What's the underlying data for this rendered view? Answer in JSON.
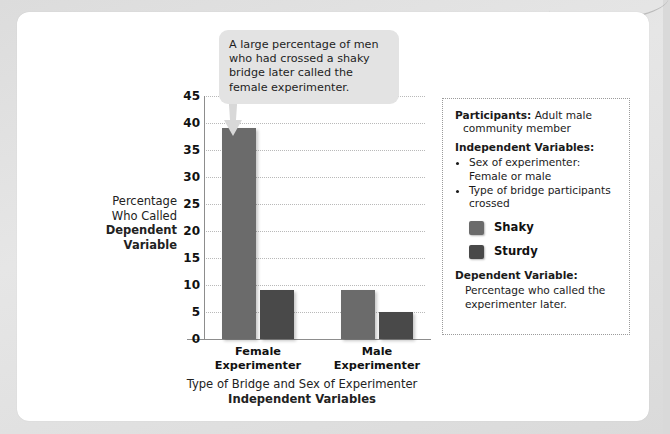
{
  "callout": {
    "text": "A large percentage of men who had crossed a shaky bridge later called the female experimenter."
  },
  "chart_data": {
    "type": "bar",
    "title": "",
    "categories": [
      "Female Experimenter",
      "Male Experimenter"
    ],
    "series": [
      {
        "name": "Shaky",
        "values": [
          39,
          9
        ],
        "color": "#6b6b6b"
      },
      {
        "name": "Sturdy",
        "values": [
          9,
          5
        ],
        "color": "#494949"
      }
    ],
    "xlabel_line1": "Type of Bridge and Sex of Experimenter",
    "xlabel_line2": "Independent Variables",
    "ylabel_line1": "Percentage",
    "ylabel_line2": "Who Called",
    "ylabel_line3": "Dependent",
    "ylabel_line4": "Variable",
    "ylim": [
      0,
      45
    ],
    "ytick_step": 5,
    "yticks": [
      "0",
      "5",
      "10",
      "15",
      "20",
      "25",
      "30",
      "35",
      "40",
      "45"
    ],
    "grid": true,
    "legend_position": "right"
  },
  "info": {
    "participants_label": "Participants:",
    "participants_value": " Adult male",
    "participants_value2": "community member",
    "iv_label": "Independent Variables:",
    "iv_items": [
      "Sex of experimenter: Female or male",
      "Type of bridge participants crossed"
    ],
    "legend": [
      {
        "label": "Shaky",
        "color": "#6b6b6b"
      },
      {
        "label": "Sturdy",
        "color": "#494949"
      }
    ],
    "dv_label": "Dependent Variable:",
    "dv_text": "Percentage who called the experimenter later."
  }
}
